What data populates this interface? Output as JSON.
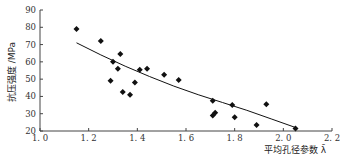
{
  "chart_data": {
    "type": "scatter",
    "title": "",
    "xlabel": "平均孔径参数 λ̄",
    "ylabel": "抗压强度 /MPa",
    "xlim": [
      1.0,
      2.2
    ],
    "ylim": [
      20,
      90
    ],
    "x_ticks": [
      "1.0",
      "1.2",
      "1.4",
      "1.6",
      "1.8",
      "2.0",
      "2.2"
    ],
    "y_ticks": [
      "20",
      "30",
      "40",
      "50",
      "60",
      "70",
      "80",
      "90"
    ],
    "grid": false,
    "legend": null,
    "series": [
      {
        "name": "measured",
        "marker": "diamond",
        "color": "#111111",
        "points": [
          {
            "x": 1.15,
            "y": 79
          },
          {
            "x": 1.25,
            "y": 72
          },
          {
            "x": 1.29,
            "y": 49
          },
          {
            "x": 1.3,
            "y": 60
          },
          {
            "x": 1.32,
            "y": 56
          },
          {
            "x": 1.33,
            "y": 64.5
          },
          {
            "x": 1.34,
            "y": 42.5
          },
          {
            "x": 1.37,
            "y": 41
          },
          {
            "x": 1.39,
            "y": 48
          },
          {
            "x": 1.41,
            "y": 55.5
          },
          {
            "x": 1.44,
            "y": 56
          },
          {
            "x": 1.51,
            "y": 52.5
          },
          {
            "x": 1.57,
            "y": 49.5
          },
          {
            "x": 1.71,
            "y": 37.5
          },
          {
            "x": 1.71,
            "y": 29
          },
          {
            "x": 1.72,
            "y": 30.5
          },
          {
            "x": 1.79,
            "y": 35
          },
          {
            "x": 1.8,
            "y": 28
          },
          {
            "x": 1.89,
            "y": 23.5
          },
          {
            "x": 1.93,
            "y": 35.5
          },
          {
            "x": 2.05,
            "y": 21.5
          }
        ]
      },
      {
        "name": "fit",
        "type": "line",
        "color": "#111111",
        "points": [
          {
            "x": 1.15,
            "y": 71
          },
          {
            "x": 1.25,
            "y": 64
          },
          {
            "x": 1.35,
            "y": 57.5
          },
          {
            "x": 1.45,
            "y": 51.5
          },
          {
            "x": 1.55,
            "y": 46
          },
          {
            "x": 1.65,
            "y": 41
          },
          {
            "x": 1.75,
            "y": 36.5
          },
          {
            "x": 1.85,
            "y": 32
          },
          {
            "x": 1.95,
            "y": 27
          },
          {
            "x": 2.05,
            "y": 22
          }
        ]
      }
    ]
  }
}
